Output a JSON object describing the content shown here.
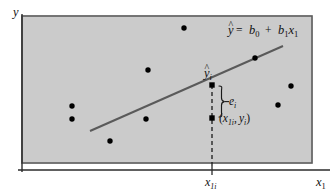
{
  "figure": {
    "type": "scatter-with-regression-line",
    "background_color": "#ffffff",
    "plot_area_color": "#c9c9c9",
    "plot_border_color": "#4a4a4a",
    "axis_color": "#2b2b2b",
    "line_color": "#5a5a5a",
    "point_color": "#000000",
    "text_color": "#111111"
  },
  "axes": {
    "y_label": "y",
    "x_label": "x",
    "x_label_subscript": "1",
    "x_tick_label": "x",
    "x_tick_subscript": "1i",
    "x_tick_value_x": 212
  },
  "equation": {
    "yhat": "y",
    "hat_symbol": "^",
    "equals": "=",
    "intercept": "b",
    "intercept_subscript": "0",
    "plus": "+",
    "slope": "b",
    "slope_subscript": "1",
    "slope_var": "x",
    "slope_var_subscript": "1",
    "full_text": "ŷ = b0 + b1x1"
  },
  "annotations": {
    "fitted_point_label": "y",
    "fitted_point_hat": "^",
    "fitted_point_subscript": "i",
    "residual_label": "e",
    "residual_subscript": "i",
    "observed_point_label": "(x1i, yi)",
    "observed_open_paren": "(",
    "observed_x": "x",
    "observed_x_subscript": "1i",
    "observed_comma": ",",
    "observed_y": "y",
    "observed_y_subscript": "i",
    "observed_close_paren": ")"
  },
  "chart_data": {
    "type": "scatter",
    "title": "",
    "xlabel": "x1",
    "ylabel": "y",
    "grid": false,
    "legend": null,
    "plot_area_px": {
      "x0": 22,
      "y0": 16,
      "x1": 312,
      "y1": 163
    },
    "regression_line_px": {
      "x0": 90,
      "y0": 131,
      "x1": 283,
      "y1": 46
    },
    "scatter_points_px": [
      {
        "x": 184,
        "y": 28
      },
      {
        "x": 148,
        "y": 70
      },
      {
        "x": 255,
        "y": 58
      },
      {
        "x": 291,
        "y": 86
      },
      {
        "x": 72,
        "y": 106
      },
      {
        "x": 72,
        "y": 119
      },
      {
        "x": 146,
        "y": 119
      },
      {
        "x": 278,
        "y": 105
      },
      {
        "x": 110,
        "y": 141
      }
    ],
    "fitted_point_px": {
      "x": 212,
      "y": 85
    },
    "observed_point_px": {
      "x": 212,
      "y": 118
    },
    "residual_segment_px": {
      "x": 212,
      "y_top": 85,
      "y_bottom": 118
    }
  }
}
